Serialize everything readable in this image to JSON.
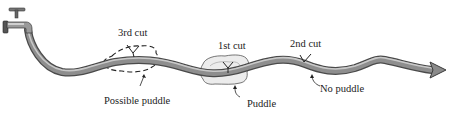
{
  "diagram": {
    "labels": {
      "cut3": "3rd cut",
      "cut1": "1st cut",
      "cut2": "2nd cut",
      "possible_puddle": "Possible puddle",
      "puddle": "Puddle",
      "no_puddle": "No puddle"
    },
    "icons": {
      "tap": "water-tap-icon",
      "hose": "garden-hose",
      "arrow": "arrow-head"
    },
    "colors": {
      "hose_dark": "#5a5a5a",
      "hose_mid": "#8a8a8a",
      "hose_light": "#c8c8c8",
      "puddle_fill": "#ececec",
      "ink": "#222222"
    }
  }
}
